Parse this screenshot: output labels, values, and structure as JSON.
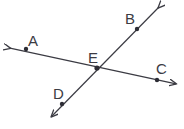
{
  "figure": {
    "kind": "geometry-diagram",
    "width": 184,
    "height": 129,
    "background_color": "#ffffff",
    "stroke_color": "#3b3b43",
    "label_color": "#3b3b43",
    "stroke_width": 1.2,
    "point_radius": 2.2
  },
  "labels": {
    "a": "A",
    "b": "B",
    "c": "C",
    "d": "D",
    "e": "E"
  },
  "points": [
    {
      "name": "A",
      "label": "A",
      "x": 26,
      "y": 49,
      "label_x": 28,
      "label_y": 33
    },
    {
      "name": "B",
      "label": "B",
      "x": 137,
      "y": 29,
      "label_x": 125,
      "label_y": 11
    },
    {
      "name": "C",
      "label": "C",
      "x": 157,
      "y": 80,
      "label_x": 156,
      "label_y": 61
    },
    {
      "name": "D",
      "label": "D",
      "x": 62,
      "y": 104,
      "label_x": 53,
      "label_y": 86
    },
    {
      "name": "E",
      "label": "E",
      "x": 97,
      "y": 68,
      "label_x": 88,
      "label_y": 50
    }
  ],
  "lines": [
    {
      "name": "line-AC",
      "through": [
        "A",
        "E",
        "C"
      ],
      "start_arrow": {
        "x": 6,
        "y": 49
      },
      "end_arrow": {
        "x": 180,
        "y": 85
      },
      "double_headed": true
    },
    {
      "name": "line-BD",
      "through": [
        "B",
        "E",
        "D"
      ],
      "start_arrow": {
        "x": 162,
        "y": 4
      },
      "end_arrow": {
        "x": 48,
        "y": 120
      },
      "double_headed": true
    }
  ]
}
